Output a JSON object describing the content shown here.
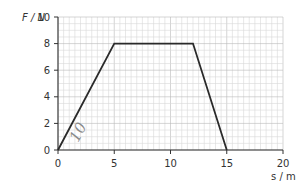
{
  "chart_data": {
    "type": "line",
    "title": "",
    "xlabel": "s / m",
    "ylabel": "F / N",
    "xlim": [
      0,
      20
    ],
    "ylim": [
      0,
      10
    ],
    "x_ticks": [
      0,
      5,
      10,
      15,
      20
    ],
    "y_ticks": [
      0,
      2,
      4,
      6,
      8,
      10
    ],
    "grid": true,
    "minor_grid_step": 0.5,
    "series": [
      {
        "name": "Force vs displacement",
        "points": [
          [
            0,
            0
          ],
          [
            5,
            8
          ],
          [
            12,
            8
          ],
          [
            15,
            0
          ]
        ]
      }
    ],
    "annotations": [
      {
        "text": "10",
        "style": "handwritten pencil mark",
        "approx_position": [
          2.5,
          1.2
        ]
      }
    ]
  },
  "labels": {
    "y_axis": "F / N",
    "x_axis": "s / m",
    "handwritten": "10"
  },
  "colors": {
    "grid_minor": "#d9d9d9",
    "grid_major": "#b8b8b8",
    "axis": "#333333",
    "line": "#2a2a2a",
    "pencil": "#8a8a8a"
  }
}
